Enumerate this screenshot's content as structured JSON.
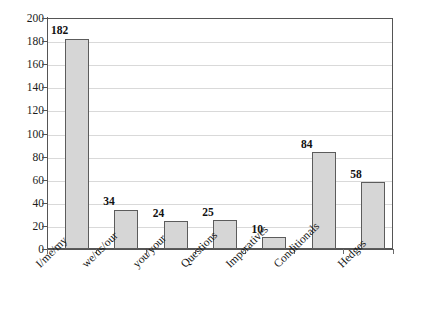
{
  "chart_data": {
    "type": "bar",
    "title": "",
    "subtitle": "",
    "xlabel": "",
    "ylabel": "",
    "ylim": [
      0,
      200
    ],
    "ytick_step": 20,
    "yticks": [
      0,
      20,
      40,
      60,
      80,
      100,
      120,
      140,
      160,
      180,
      200
    ],
    "grid": true,
    "legend": false,
    "legend_position": "none",
    "categories": [
      "I/me/my",
      "we/us/our",
      "you/your",
      "Questions",
      "Imperatives",
      "Conditionals",
      "Hedges"
    ],
    "values": [
      182,
      34,
      24,
      25,
      10,
      84,
      58
    ],
    "data_labels": [
      "182",
      "34",
      "24",
      "25",
      "10",
      "84",
      "58"
    ],
    "bar_fill_color": "#d6d6d6",
    "bar_border_color": "#5c5c5c",
    "gridline_color": "#d9d9d9",
    "axis_color": "#555555",
    "background_color": "#ffffff",
    "category_label_rotation_deg": -45
  },
  "axis": {
    "y_tick_labels": [
      "200",
      "180",
      "160",
      "140",
      "120",
      "100",
      "80",
      "60",
      "40",
      "20",
      "0"
    ]
  }
}
